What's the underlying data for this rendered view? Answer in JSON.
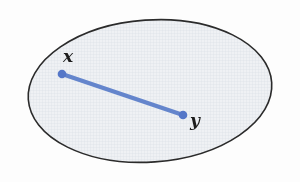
{
  "figure": {
    "kind": "set-diagram",
    "canvas": {
      "width": 300,
      "height": 182
    },
    "background_color": "#fdfdfd",
    "region": {
      "shape": "ellipse",
      "label": "",
      "center_x": 150,
      "center_y": 91,
      "radius_x": 122,
      "radius_y": 71,
      "rotation_deg": -4,
      "stroke_color": "#2b2b2b",
      "stroke_width": 1.6,
      "fill_color": "#eff1f4"
    },
    "segment": {
      "stroke_color": "#6485cc",
      "stroke_width": 4.2,
      "from": {
        "x": 62,
        "y": 74
      },
      "to": {
        "x": 183,
        "y": 115
      }
    },
    "points": [
      {
        "id": "x",
        "label": "x",
        "x": 62,
        "y": 74,
        "radius": 4.3,
        "color": "#5577c8",
        "label_x": 63,
        "label_y": 48
      },
      {
        "id": "y",
        "label": "y",
        "x": 183,
        "y": 115,
        "radius": 4.3,
        "color": "#5577c8",
        "label_x": 190,
        "label_y": 112
      }
    ],
    "texture": {
      "grid_color": "#c9d2dc",
      "grid_spacing": 3,
      "opacity": 0.55
    }
  }
}
